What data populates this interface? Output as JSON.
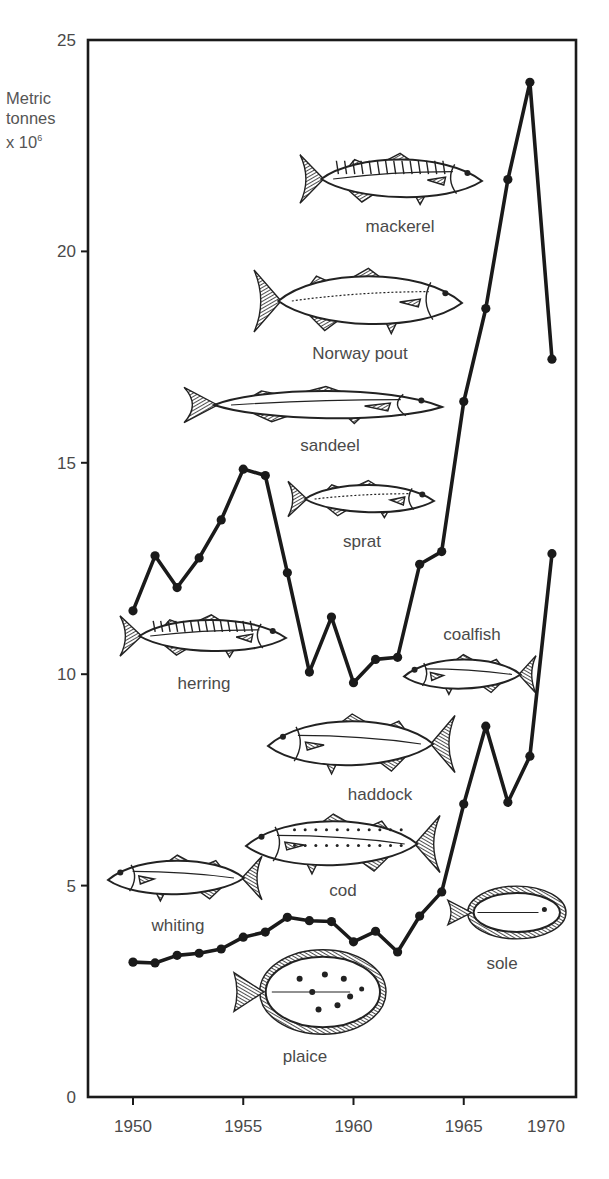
{
  "chart_data": {
    "type": "line",
    "title": "",
    "ylabel": "Metric tonnes x 10^6",
    "ylabel_lines": [
      "Metric",
      "tonnes",
      "x 10"
    ],
    "ylabel_exponent": "6",
    "xlabel": "",
    "xlim": [
      1948.3,
      1970
    ],
    "ylim": [
      0,
      25
    ],
    "x_ticks": [
      1950,
      1955,
      1960,
      1965,
      1970
    ],
    "y_ticks": [
      0,
      5,
      10,
      15,
      20,
      25
    ],
    "grid": false,
    "legend": "none (fish illustrations label the species)",
    "x": [
      1950,
      1951,
      1952,
      1953,
      1954,
      1955,
      1956,
      1957,
      1958,
      1959,
      1960,
      1961,
      1962,
      1963,
      1964,
      1965,
      1966,
      1967,
      1968,
      1969
    ],
    "series": [
      {
        "name": "Total catch (upper line)",
        "values": [
          11.5,
          12.8,
          12.05,
          12.75,
          13.65,
          14.85,
          14.7,
          12.4,
          10.05,
          11.35,
          9.8,
          10.35,
          10.4,
          12.6,
          12.9,
          16.45,
          18.65,
          21.7,
          24.0,
          17.45
        ]
      },
      {
        "name": "Lower line (demersal species)",
        "values": [
          3.19,
          3.17,
          3.35,
          3.4,
          3.5,
          3.78,
          3.9,
          4.25,
          4.17,
          4.15,
          3.67,
          3.92,
          3.43,
          4.28,
          4.85,
          6.93,
          8.77,
          6.97,
          8.06,
          12.85
        ]
      }
    ],
    "annotations": [
      "mackerel",
      "Norway pout",
      "sandeel",
      "sprat",
      "herring",
      "coalfish",
      "haddock",
      "cod",
      "whiting",
      "sole",
      "plaice"
    ]
  },
  "fish": [
    {
      "id": "mackerel",
      "label": "mackerel",
      "x": 300,
      "y": 150,
      "w": 182,
      "h": 58,
      "facing": "right",
      "lx": 400,
      "ly": 232
    },
    {
      "id": "norway-pout",
      "label": "Norway pout",
      "x": 254,
      "y": 264,
      "w": 208,
      "h": 74,
      "facing": "right",
      "lx": 360,
      "ly": 359
    },
    {
      "id": "sandeel",
      "label": "sandeel",
      "x": 184,
      "y": 384,
      "w": 258,
      "h": 42,
      "facing": "right",
      "lx": 330,
      "ly": 451
    },
    {
      "id": "sprat",
      "label": "sprat",
      "x": 288,
      "y": 478,
      "w": 146,
      "h": 42,
      "facing": "right",
      "lx": 362,
      "ly": 547
    },
    {
      "id": "herring",
      "label": "herring",
      "x": 120,
      "y": 612,
      "w": 166,
      "h": 48,
      "facing": "right",
      "lx": 204,
      "ly": 689
    },
    {
      "id": "coalfish",
      "label": "coalfish",
      "x": 404,
      "y": 652,
      "w": 132,
      "h": 45,
      "facing": "left",
      "lx": 472,
      "ly": 640
    },
    {
      "id": "haddock",
      "label": "haddock",
      "x": 268,
      "y": 710,
      "w": 187,
      "h": 68,
      "facing": "left",
      "lx": 380,
      "ly": 800
    },
    {
      "id": "cod",
      "label": "cod",
      "x": 246,
      "y": 810,
      "w": 194,
      "h": 68,
      "facing": "left",
      "lx": 343,
      "ly": 896
    },
    {
      "id": "whiting",
      "label": "whiting",
      "x": 108,
      "y": 852,
      "w": 154,
      "h": 52,
      "facing": "left",
      "lx": 178,
      "ly": 931
    },
    {
      "id": "sole",
      "label": "sole",
      "x": 448,
      "y": 885,
      "w": 120,
      "h": 55,
      "facing": "left",
      "flat": true,
      "lx": 502,
      "ly": 969
    },
    {
      "id": "plaice",
      "label": "plaice",
      "x": 234,
      "y": 948,
      "w": 154,
      "h": 88,
      "facing": "left",
      "flat": true,
      "lx": 305,
      "ly": 1062
    }
  ],
  "colors": {
    "line": "#1a1a1a",
    "axis": "#1a1a1a",
    "text": "#4a4a4a",
    "background": "#ffffff"
  }
}
